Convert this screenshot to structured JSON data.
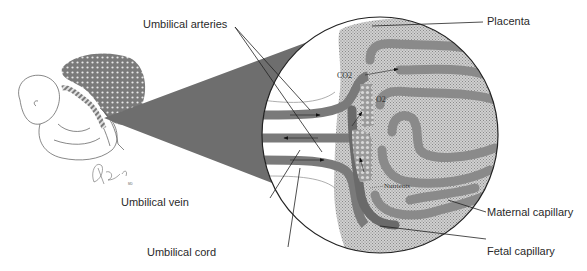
{
  "labels": {
    "umbilical_arteries": "Umbilical arteries",
    "placenta": "Placenta",
    "umbilical_vein": "Umbilical vein",
    "umbilical_cord": "Umbilical cord",
    "maternal_capillary": "Maternal capillary",
    "fetal_capillary": "Fetal capillary"
  },
  "inner_labels": {
    "co2": "CO2",
    "o2": "O2",
    "nutrients": "Nutrients"
  },
  "signature": "A Bade MD",
  "colors": {
    "vessel": "#7a7a7a",
    "cone": "#6e6e6e",
    "placenta_fill": "#c8c8c8",
    "line": "#222222",
    "exchange_dots": "#a8a8a8"
  }
}
